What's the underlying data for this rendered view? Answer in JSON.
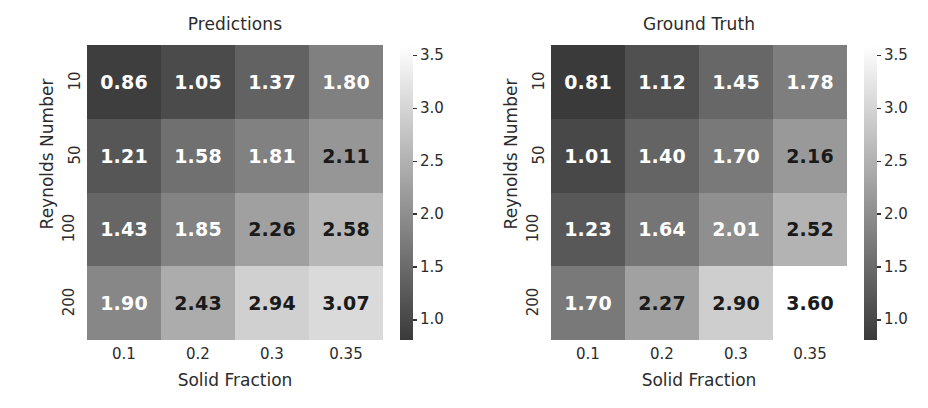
{
  "figure": {
    "width": 928,
    "height": 408,
    "background": "#ffffff"
  },
  "chart_data": {
    "type": "heatmap",
    "panels": [
      {
        "title": "Predictions",
        "xlabel": "Solid Fraction",
        "ylabel": "Reynolds Number",
        "xticklabels": [
          "0.1",
          "0.2",
          "0.3",
          "0.35"
        ],
        "yticklabels": [
          "10",
          "50",
          "100",
          "200"
        ],
        "values": [
          [
            0.86,
            1.05,
            1.37,
            1.8
          ],
          [
            1.21,
            1.58,
            1.81,
            2.11
          ],
          [
            1.43,
            1.85,
            2.26,
            2.58
          ],
          [
            1.9,
            2.43,
            2.94,
            3.07
          ]
        ],
        "annotations": [
          [
            "0.86",
            "1.05",
            "1.37",
            "1.80"
          ],
          [
            "1.21",
            "1.58",
            "1.81",
            "2.11"
          ],
          [
            "1.43",
            "1.85",
            "2.26",
            "2.58"
          ],
          [
            "1.90",
            "2.43",
            "2.94",
            "3.07"
          ]
        ],
        "colorbar": {
          "ticks": [
            "3.5",
            "3.0",
            "2.5",
            "2.0",
            "1.5",
            "1.0"
          ],
          "tickvalues": [
            3.5,
            3.0,
            2.5,
            2.0,
            1.5,
            1.0
          ],
          "vmin": 0.81,
          "vmax": 3.6,
          "cmap": "gray"
        }
      },
      {
        "title": "Ground Truth",
        "xlabel": "Solid Fraction",
        "ylabel": "Reynolds Number",
        "xticklabels": [
          "0.1",
          "0.2",
          "0.3",
          "0.35"
        ],
        "yticklabels": [
          "10",
          "50",
          "100",
          "200"
        ],
        "values": [
          [
            0.81,
            1.12,
            1.45,
            1.78
          ],
          [
            1.01,
            1.4,
            1.7,
            2.16
          ],
          [
            1.23,
            1.64,
            2.01,
            2.52
          ],
          [
            1.7,
            2.27,
            2.9,
            3.6
          ]
        ],
        "annotations": [
          [
            "0.81",
            "1.12",
            "1.45",
            "1.78"
          ],
          [
            "1.01",
            "1.40",
            "1.70",
            "2.16"
          ],
          [
            "1.23",
            "1.64",
            "2.01",
            "2.52"
          ],
          [
            "1.70",
            "2.27",
            "2.90",
            "3.60"
          ]
        ],
        "colorbar": {
          "ticks": [
            "3.5",
            "3.0",
            "2.5",
            "2.0",
            "1.5",
            "1.0"
          ],
          "tickvalues": [
            3.5,
            3.0,
            2.5,
            2.0,
            1.5,
            1.0
          ],
          "vmin": 0.81,
          "vmax": 3.6,
          "cmap": "gray"
        }
      }
    ],
    "colors": {
      "text_dark": "#1a1a1a",
      "text_light": "#ffffff",
      "axis_text": "#2b2b2b",
      "cmap_low": "#3a3a3a",
      "cmap_high": "#ffffff"
    },
    "text_color_threshold": 2.05
  }
}
